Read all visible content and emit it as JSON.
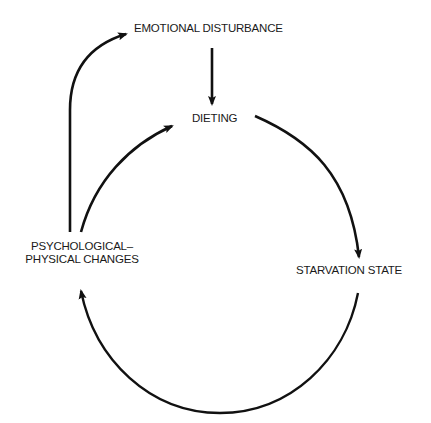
{
  "diagram": {
    "type": "cycle",
    "nodes": [
      {
        "id": "emotional",
        "label": "EMOTIONAL DISTURBANCE"
      },
      {
        "id": "dieting",
        "label": "DIETING"
      },
      {
        "id": "starvation",
        "label": "STARVATION STATE"
      },
      {
        "id": "psych",
        "label_line1": "PSYCHOLOGICAL–",
        "label_line2": "PHYSICAL CHANGES"
      }
    ],
    "edges": [
      {
        "from": "emotional",
        "to": "dieting"
      },
      {
        "from": "dieting",
        "to": "starvation"
      },
      {
        "from": "starvation",
        "to": "psych"
      },
      {
        "from": "psych",
        "to": "dieting"
      },
      {
        "from": "psych",
        "to": "emotional"
      }
    ],
    "colors": {
      "stroke": "#111111",
      "text": "#1a1a1a",
      "background": "#ffffff"
    }
  }
}
